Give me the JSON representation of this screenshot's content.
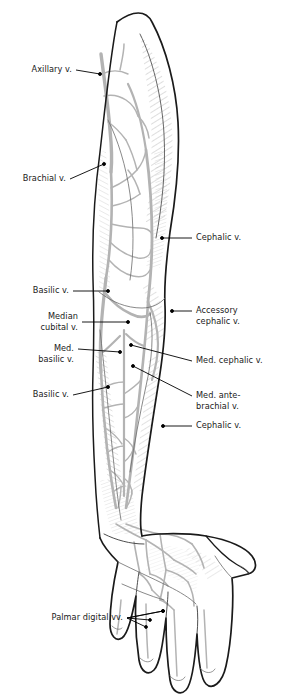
{
  "figure": {
    "colors": {
      "outline": "#1a1a1a",
      "vein": "#b3b3b3",
      "shading": "#8c8c8c",
      "leader": "#000000",
      "background": "#ffffff"
    }
  },
  "labels": [
    {
      "id": "axillary-vein",
      "text": "Axillary v.",
      "side": "left",
      "x": 14,
      "y": 64,
      "lx": 76,
      "ly": 70,
      "tx": 100,
      "ty": 74
    },
    {
      "id": "brachial-vein",
      "text": "Brachial v.",
      "side": "left",
      "x": 12,
      "y": 173,
      "lx": 70,
      "ly": 179,
      "tx": 104,
      "ty": 164
    },
    {
      "id": "cephalic-vein-upper",
      "text": "Cephalic v.",
      "side": "right",
      "x": 196,
      "y": 232,
      "lx": 192,
      "ly": 238,
      "tx": 162,
      "ty": 238
    },
    {
      "id": "basilic-vein-upper",
      "text": "Basilic v.",
      "side": "left",
      "x": 20,
      "y": 285,
      "lx": 73,
      "ly": 291,
      "tx": 108,
      "ty": 291
    },
    {
      "id": "accessory-cephalic-vein",
      "text": "Accessory\ncephalic v.",
      "side": "right",
      "x": 196,
      "y": 305,
      "lx": 192,
      "ly": 311,
      "tx": 172,
      "ty": 311
    },
    {
      "id": "median-cubital-vein",
      "text": "Median\ncubital v.",
      "side": "left",
      "x": 24,
      "y": 311,
      "lx": 82,
      "ly": 322,
      "tx": 128,
      "ty": 322
    },
    {
      "id": "median-basilic-vein",
      "text": "Med.\nbasilic v.",
      "side": "left",
      "x": 30,
      "y": 343,
      "lx": 78,
      "ly": 349,
      "tx": 120,
      "ty": 352
    },
    {
      "id": "median-cephalic-vein",
      "text": "Med. cephalic v.",
      "side": "right",
      "x": 196,
      "y": 355,
      "lx": 192,
      "ly": 361,
      "tx": 131,
      "ty": 345
    },
    {
      "id": "basilic-vein-lower",
      "text": "Basilic v.",
      "side": "left",
      "x": 20,
      "y": 389,
      "lx": 73,
      "ly": 395,
      "tx": 108,
      "ty": 387
    },
    {
      "id": "median-antebrachial-vein",
      "text": "Med. ante-\nbrachial v.",
      "side": "right",
      "x": 196,
      "y": 390,
      "lx": 192,
      "ly": 396,
      "tx": 133,
      "ty": 366
    },
    {
      "id": "cephalic-vein-lower",
      "text": "Cephalic v.",
      "side": "right",
      "x": 196,
      "y": 420,
      "lx": 192,
      "ly": 426,
      "tx": 163,
      "ty": 426
    },
    {
      "id": "palmar-digital-veins",
      "text": "Palmar digital vv.",
      "side": "left",
      "x": 47,
      "y": 612,
      "lx": 127,
      "ly": 618,
      "tx": 163,
      "ty": 611
    }
  ],
  "structures": [
    {
      "id": "shoulder-deltoid",
      "name": "deltoid / shoulder contour"
    },
    {
      "id": "upper-arm",
      "name": "arm (brachium)"
    },
    {
      "id": "cubital-fossa",
      "name": "cubital fossa / elbow"
    },
    {
      "id": "forearm",
      "name": "forearm (antebrachium)"
    },
    {
      "id": "wrist",
      "name": "wrist"
    },
    {
      "id": "hand-palm",
      "name": "palm of hand"
    },
    {
      "id": "thumb",
      "name": "thumb"
    },
    {
      "id": "digit-2",
      "name": "index finger"
    },
    {
      "id": "digit-3",
      "name": "middle finger"
    },
    {
      "id": "digit-4",
      "name": "ring finger"
    },
    {
      "id": "digit-5",
      "name": "little finger"
    }
  ]
}
